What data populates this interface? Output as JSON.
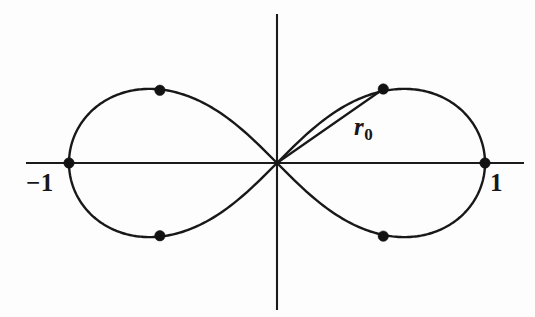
{
  "figure": {
    "kind": "lemniscate-of-bernoulli-plot",
    "background_color": "#fdfdfd",
    "ink_color": "#181818",
    "width": 535,
    "height": 317
  },
  "axes": {
    "x_axis_name": "horizontal-axis",
    "y_axis_name": "vertical-axis",
    "origin_px": {
      "x": 277,
      "y": 163
    },
    "x_axis_extent_px": {
      "x1": 26,
      "x2": 524
    },
    "y_axis_extent_px": {
      "y1": 14,
      "y2": 310
    },
    "labels": [
      {
        "name": "x-axis-label-negative-one",
        "text": "−1",
        "value": -1
      },
      {
        "name": "x-axis-label-positive-one",
        "text": "1",
        "value": 1
      }
    ]
  },
  "annotations": {
    "radius_label": {
      "text": "r",
      "subscript": "0",
      "full": "r₀"
    },
    "radius_line_name": "radius-segment-r0"
  },
  "chart_data": {
    "type": "line",
    "title": "",
    "subtitle": "",
    "xlabel": "",
    "ylabel": "",
    "curve_equation": "r^2 = cos(2θ)",
    "curve_name": "Lemniscate of Bernoulli",
    "xlim": [
      -1.2,
      1.2
    ],
    "ylim": [
      -0.72,
      0.72
    ],
    "grid": false,
    "legend": null,
    "axis_tick_labels": {
      "x": [
        "−1",
        "1"
      ],
      "y": []
    },
    "series": [
      {
        "name": "lemniscate",
        "closed": true,
        "points_theta_deg": [
          -45,
          -40,
          -35,
          -30,
          -25,
          -20,
          -15,
          -10,
          -5,
          0,
          5,
          10,
          15,
          20,
          25,
          30,
          35,
          40,
          45
        ],
        "description": "Figure-eight curve through the origin with vertices at x = ±1"
      }
    ],
    "marked_points": [
      {
        "name": "vertex-left",
        "x": -1.0,
        "y": 0.0,
        "px": {
          "x": 64,
          "y": 163
        },
        "labeled": "−1"
      },
      {
        "name": "vertex-right",
        "x": 1.0,
        "y": 0.0,
        "px": {
          "x": 485,
          "y": 163
        },
        "labeled": "1"
      },
      {
        "name": "upper-left-point",
        "x": -0.563,
        "y": 0.347,
        "px": {
          "x": 160,
          "y": 90
        }
      },
      {
        "name": "lower-left-point",
        "x": -0.563,
        "y": -0.347,
        "px": {
          "x": 160,
          "y": 235
        }
      },
      {
        "name": "upper-right-point",
        "x": 0.511,
        "y": 0.353,
        "px": {
          "x": 383,
          "y": 89
        }
      },
      {
        "name": "lower-right-point",
        "x": 0.511,
        "y": -0.349,
        "px": {
          "x": 383,
          "y": 236
        }
      }
    ],
    "radius_segment": {
      "from": {
        "x": 0,
        "y": 0
      },
      "to": {
        "x": 0.511,
        "y": 0.353
      },
      "label": "r₀"
    },
    "tangent_angle_at_origin_deg": 45
  },
  "ghost_text": {
    "note": "faint scanner bleed-through, illegible",
    "lines": [
      {
        "text": " ",
        "left": 8,
        "top": 30
      },
      {
        "text": " ",
        "left": 18,
        "top": 80
      },
      {
        "text": " ",
        "left": 300,
        "top": 30
      },
      {
        "text": " ",
        "left": 300,
        "top": 80
      },
      {
        "text": " ",
        "left": 10,
        "top": 220
      },
      {
        "text": " ",
        "left": 300,
        "top": 220
      }
    ]
  }
}
